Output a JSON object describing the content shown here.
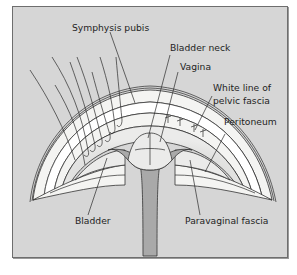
{
  "figure": {
    "type": "anatomical-diagram",
    "labels": {
      "symphysis_pubis": "Symphysis pubis",
      "bladder_neck": "Bladder neck",
      "vagina": "Vagina",
      "white_line_l1": "White line of",
      "white_line_l2": "pelvic fascia",
      "peritoneum": "Peritoneum",
      "bladder": "Bladder",
      "paravaginal_fascia": "Paravaginal fascia"
    },
    "colors": {
      "background": "#d6d6d6",
      "tissue_light": "#f4f4f2",
      "tissue_mid": "#e6e6e4",
      "vagina_grey": "#a9a9a9",
      "stroke": "#2b2b2b"
    }
  }
}
